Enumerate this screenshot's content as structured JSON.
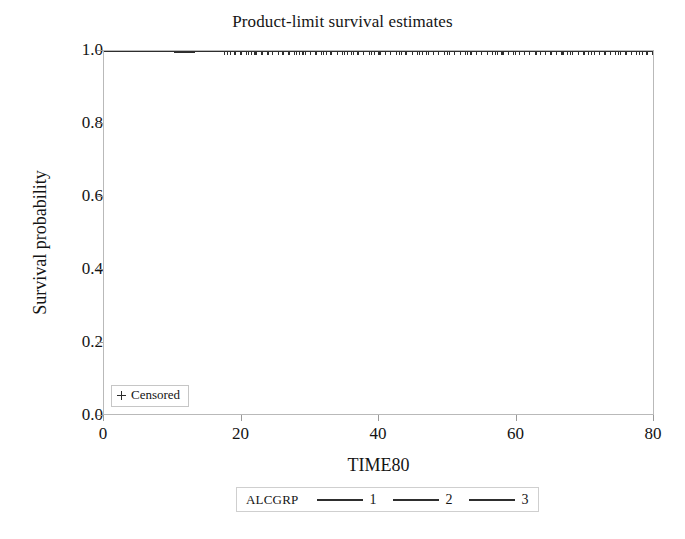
{
  "chart_data": {
    "type": "line",
    "title": "Product-limit survival estimates",
    "xlabel": "TIME80",
    "ylabel": "Survival probability",
    "xlim": [
      0,
      80
    ],
    "ylim": [
      0.0,
      1.0
    ],
    "grid": false,
    "xticks": [
      "0",
      "20",
      "40",
      "60",
      "80"
    ],
    "xtick_values": [
      0,
      20,
      40,
      60,
      80
    ],
    "yticks": [
      "0.0",
      "0.2",
      "0.4",
      "0.6",
      "0.8",
      "1.0"
    ],
    "ytick_values": [
      0.0,
      0.2,
      0.4,
      0.6,
      0.8,
      1.0
    ],
    "legend_position": "bottom-outside",
    "legend_title": "ALCGRP",
    "series": [
      {
        "name": "1",
        "color": "#2e2e2e",
        "x": [
          0,
          10,
          18,
          30,
          45,
          60,
          72,
          80
        ],
        "values": [
          1.0,
          1.0,
          1.0,
          1.0,
          1.0,
          1.0,
          1.0,
          1.0
        ],
        "censored_x": [
          18,
          21,
          24,
          27,
          31,
          35,
          39,
          44,
          48,
          53,
          58,
          63,
          68,
          73,
          78,
          80
        ]
      },
      {
        "name": "2",
        "color": "#2e2e2e",
        "x": [
          0,
          10,
          18,
          30,
          45,
          60,
          72,
          80
        ],
        "values": [
          1.0,
          1.0,
          1.0,
          1.0,
          1.0,
          1.0,
          1.0,
          1.0
        ],
        "censored_x": [
          19,
          22,
          26,
          29,
          33,
          37,
          41,
          46,
          50,
          55,
          60,
          65,
          70,
          75,
          79,
          80
        ]
      },
      {
        "name": "3",
        "color": "#2e2e2e",
        "x": [
          0,
          10,
          18,
          30,
          45,
          60,
          72,
          80
        ],
        "values": [
          1.0,
          1.0,
          1.0,
          1.0,
          1.0,
          1.0,
          1.0,
          1.0
        ],
        "censored_x": [
          20,
          23,
          28,
          32,
          36,
          40,
          43,
          47,
          52,
          57,
          62,
          67,
          71,
          76,
          80
        ]
      }
    ],
    "annotations": [
      "Censored"
    ]
  },
  "title": "Product-limit survival estimates",
  "axes": {
    "y_label": "Survival probability",
    "x_label": "TIME80",
    "y_ticks": [
      "1.0",
      "0.8",
      "0.6",
      "0.4",
      "0.2",
      "0.0"
    ],
    "x_ticks": [
      "0",
      "20",
      "40",
      "60",
      "80"
    ]
  },
  "censored_legend": {
    "label": "Censored",
    "marker": "plus-marker"
  },
  "group_legend": {
    "title": "ALCGRP",
    "entries": [
      {
        "label": "1"
      },
      {
        "label": "2"
      },
      {
        "label": "3"
      }
    ]
  }
}
